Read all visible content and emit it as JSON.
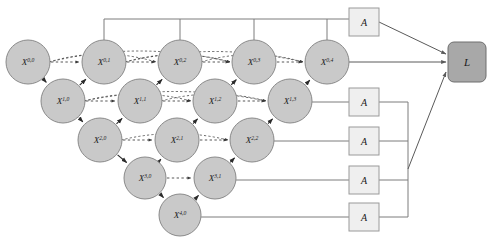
{
  "diagram": {
    "type": "neural-network-architecture",
    "colors": {
      "node_fill": "#c9c9c9",
      "node_stroke": "#8a8a8a",
      "supervision_box_fill": "#efefef",
      "supervision_box_stroke": "#9a9a9a",
      "loss_box_fill": "#a8a8a8",
      "loss_box_stroke": "#6e6e6e",
      "solid_edge": "#2b2b2b",
      "dashed_edge": "#3a3a3a",
      "bus_line": "#7d7d7d",
      "background": "#ffffff"
    },
    "nodes": [
      {
        "name": "node-x-0-0",
        "base": "X",
        "sup": "0,0",
        "cx": 28,
        "cy": 62,
        "r": 22
      },
      {
        "name": "node-x-0-1",
        "base": "X",
        "sup": "0,1",
        "cx": 104,
        "cy": 62,
        "r": 22
      },
      {
        "name": "node-x-0-2",
        "base": "X",
        "sup": "0,2",
        "cx": 180,
        "cy": 62,
        "r": 22
      },
      {
        "name": "node-x-0-3",
        "base": "X",
        "sup": "0,3",
        "cx": 254,
        "cy": 62,
        "r": 22
      },
      {
        "name": "node-x-0-4",
        "base": "X",
        "sup": "0,4",
        "cx": 327,
        "cy": 62,
        "r": 22
      },
      {
        "name": "node-x-1-0",
        "base": "X",
        "sup": "1,0",
        "cx": 63,
        "cy": 101,
        "r": 22
      },
      {
        "name": "node-x-1-1",
        "base": "X",
        "sup": "1,1",
        "cx": 140,
        "cy": 101,
        "r": 22
      },
      {
        "name": "node-x-1-2",
        "base": "X",
        "sup": "1,2",
        "cx": 215,
        "cy": 101,
        "r": 22
      },
      {
        "name": "node-x-1-3",
        "base": "X",
        "sup": "1,3",
        "cx": 290,
        "cy": 101,
        "r": 22
      },
      {
        "name": "node-x-2-0",
        "base": "X",
        "sup": "2,0",
        "cx": 100,
        "cy": 140,
        "r": 22
      },
      {
        "name": "node-x-2-1",
        "base": "X",
        "sup": "2,1",
        "cx": 177,
        "cy": 140,
        "r": 22
      },
      {
        "name": "node-x-2-2",
        "base": "X",
        "sup": "2,2",
        "cx": 252,
        "cy": 140,
        "r": 22
      },
      {
        "name": "node-x-3-0",
        "base": "X",
        "sup": "3,0",
        "cx": 145,
        "cy": 178,
        "r": 21
      },
      {
        "name": "node-x-3-1",
        "base": "X",
        "sup": "3,1",
        "cx": 215,
        "cy": 178,
        "r": 21
      },
      {
        "name": "node-x-4-0",
        "base": "X",
        "sup": "4,0",
        "cx": 180,
        "cy": 215,
        "r": 21
      }
    ],
    "supervision_boxes": [
      {
        "name": "supervision-box-1",
        "label": "A",
        "x": 349,
        "y": 8,
        "w": 30,
        "h": 28
      },
      {
        "name": "supervision-box-2",
        "label": "A",
        "x": 349,
        "y": 88,
        "w": 30,
        "h": 28
      },
      {
        "name": "supervision-box-3",
        "label": "A",
        "x": 349,
        "y": 127,
        "w": 30,
        "h": 28
      },
      {
        "name": "supervision-box-4",
        "label": "A",
        "x": 349,
        "y": 166,
        "w": 30,
        "h": 28
      },
      {
        "name": "supervision-box-5",
        "label": "A",
        "x": 349,
        "y": 203,
        "w": 30,
        "h": 28
      }
    ],
    "loss_box": {
      "name": "loss-box",
      "label": "L",
      "x": 448,
      "y": 42,
      "w": 38,
      "h": 40,
      "radius": 6
    },
    "encoder_edges": [
      {
        "from": "node-x-0-0",
        "to": "node-x-1-0"
      },
      {
        "from": "node-x-1-0",
        "to": "node-x-2-0"
      },
      {
        "from": "node-x-2-0",
        "to": "node-x-3-0"
      },
      {
        "from": "node-x-3-0",
        "to": "node-x-4-0"
      }
    ],
    "decoder_edges": [
      {
        "from": "node-x-1-0",
        "to": "node-x-0-1"
      },
      {
        "from": "node-x-1-1",
        "to": "node-x-0-2"
      },
      {
        "from": "node-x-1-2",
        "to": "node-x-0-3"
      },
      {
        "from": "node-x-1-3",
        "to": "node-x-0-4"
      },
      {
        "from": "node-x-2-0",
        "to": "node-x-1-1"
      },
      {
        "from": "node-x-2-1",
        "to": "node-x-1-2"
      },
      {
        "from": "node-x-2-2",
        "to": "node-x-1-3"
      },
      {
        "from": "node-x-3-0",
        "to": "node-x-2-1"
      },
      {
        "from": "node-x-3-1",
        "to": "node-x-2-2"
      },
      {
        "from": "node-x-4-0",
        "to": "node-x-3-1"
      }
    ],
    "skip_edges": [
      {
        "from": "node-x-0-0",
        "to": "node-x-0-1"
      },
      {
        "from": "node-x-0-1",
        "to": "node-x-0-2"
      },
      {
        "from": "node-x-0-2",
        "to": "node-x-0-3"
      },
      {
        "from": "node-x-0-3",
        "to": "node-x-0-4"
      },
      {
        "from": "node-x-1-0",
        "to": "node-x-1-1"
      },
      {
        "from": "node-x-1-1",
        "to": "node-x-1-2"
      },
      {
        "from": "node-x-1-2",
        "to": "node-x-1-3"
      },
      {
        "from": "node-x-2-0",
        "to": "node-x-2-1"
      },
      {
        "from": "node-x-2-1",
        "to": "node-x-2-2"
      },
      {
        "from": "node-x-3-0",
        "to": "node-x-3-1"
      }
    ],
    "long_skip_edges": [
      {
        "from": "node-x-0-0",
        "to": "node-x-0-2",
        "bow": -16
      },
      {
        "from": "node-x-0-0",
        "to": "node-x-0-3",
        "bow": -22
      },
      {
        "from": "node-x-0-1",
        "to": "node-x-0-3",
        "bow": -15
      },
      {
        "from": "node-x-0-1",
        "to": "node-x-0-4",
        "bow": -21
      },
      {
        "from": "node-x-0-2",
        "to": "node-x-0-4",
        "bow": -15
      },
      {
        "from": "node-x-1-0",
        "to": "node-x-1-2",
        "bow": -14
      },
      {
        "from": "node-x-1-0",
        "to": "node-x-1-3",
        "bow": -19
      },
      {
        "from": "node-x-1-1",
        "to": "node-x-1-3",
        "bow": -14
      },
      {
        "from": "node-x-2-0",
        "to": "node-x-2-2",
        "bow": -13
      }
    ],
    "top_bus": {
      "name": "top-supervision-bus",
      "y": 19,
      "x_start": 104,
      "x_end": 349,
      "drops": [
        104,
        180,
        254,
        327
      ]
    },
    "right_bus": {
      "name": "right-supervision-bus",
      "x": 408,
      "y_top": 102,
      "y_bottom": 217
    },
    "output_edges": [
      {
        "name": "output-edge-top-box-to-loss",
        "from": "supervision-box-1",
        "to": "loss-box"
      },
      {
        "name": "output-edge-x-0-4-to-loss",
        "from": "node-x-0-4",
        "to": "loss-box"
      },
      {
        "name": "output-edge-right-bus-to-loss",
        "from": "right-bus",
        "to": "loss-box"
      }
    ],
    "branch_lines": [
      {
        "name": "branch-line-x-1-3",
        "from": "node-x-1-3",
        "to": "supervision-box-2"
      },
      {
        "name": "branch-line-x-2-2",
        "from": "node-x-2-2",
        "to": "supervision-box-3"
      },
      {
        "name": "branch-line-x-3-1",
        "from": "node-x-3-1",
        "to": "supervision-box-4"
      },
      {
        "name": "branch-line-x-4-0",
        "from": "node-x-4-0",
        "to": "supervision-box-5"
      }
    ]
  }
}
